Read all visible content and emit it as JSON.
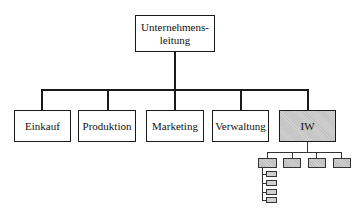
{
  "chart": {
    "root": {
      "label": "Unternehmens-\nleitung",
      "line1": "Unternehmens-",
      "line2": "leitung"
    },
    "departments": [
      {
        "label": "Einkauf",
        "highlighted": false
      },
      {
        "label": "Produktion",
        "highlighted": false
      },
      {
        "label": "Marketing",
        "highlighted": false
      },
      {
        "label": "Verwaltung",
        "highlighted": false
      },
      {
        "label": "IW",
        "highlighted": true
      }
    ],
    "iw_sub_units": {
      "count": 4,
      "first_unit_children": 4
    },
    "colors": {
      "line": "#1a1a1a",
      "highlight_fill": "#cfcfcf",
      "background": "#ffffff"
    }
  }
}
